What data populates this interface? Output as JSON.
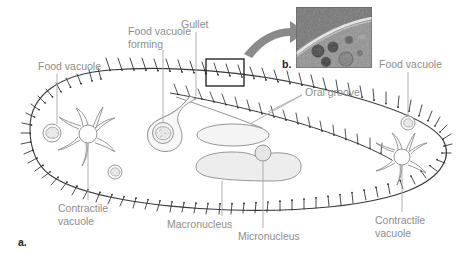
{
  "figure": {
    "panels": [
      {
        "id": "a",
        "label": "a.",
        "type": "illustration",
        "subject": "Paramecium cell diagram"
      },
      {
        "id": "b",
        "label": "b.",
        "type": "micrograph",
        "subject": "light micrograph of pellicle and food vacuoles"
      }
    ]
  },
  "labels": {
    "food_vacuole_left": "Food vacuole",
    "food_vacuole_forming": "Food vacuole\nforming",
    "gullet": "Gullet",
    "food_vacuole_right": "Food vacuole",
    "oral_groove": "Oral groove",
    "contractile_vacuole_left": "Contractile\nvacuole",
    "contractile_vacuole_right": "Contractile\nvacuole",
    "macronucleus": "Macronucleus",
    "micronucleus": "Micronucleus"
  },
  "structures": [
    {
      "name": "pellicle-membrane",
      "description": "outer cell boundary with beaded basal bodies"
    },
    {
      "name": "cilia",
      "description": "short hair-like projections along entire membrane"
    },
    {
      "name": "oral-groove",
      "description": "indented ciliated channel on ventral surface"
    },
    {
      "name": "gullet",
      "description": "funnel leading inward from oral groove"
    },
    {
      "name": "forming-food-vacuole",
      "description": "vacuole budding at base of gullet"
    },
    {
      "name": "food-vacuoles",
      "description": "small rounded vesicles with granular contents"
    },
    {
      "name": "macronucleus",
      "description": "large kidney-shaped nucleus"
    },
    {
      "name": "micronucleus",
      "description": "small round nucleus adjacent to macronucleus"
    },
    {
      "name": "contractile-vacuole",
      "description": "circular vacuole with radiating collecting canals"
    },
    {
      "name": "arrow-to-micrograph",
      "description": "curved arrow from boxed region to micrograph"
    },
    {
      "name": "detail-box",
      "description": "rectangle outlining magnified membrane region"
    }
  ],
  "colors": {
    "label_text": "#8e8e8e",
    "panel_text": "#1a1a1a",
    "outline": "#666666",
    "membrane": "#333333",
    "organelle_fill": "#f2f2f2",
    "nucleus_fill": "#ebebeb",
    "arrow": "#8a8a8a",
    "leader_line": "#a8a8a8",
    "background": "#ffffff"
  }
}
